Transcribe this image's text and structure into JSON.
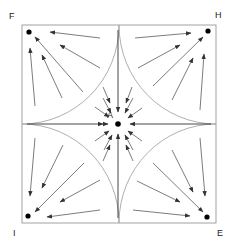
{
  "diagram": {
    "labels": {
      "top_left": "F",
      "top_right": "H",
      "bottom_left": "I",
      "bottom_right": "E",
      "center": "A"
    },
    "colors": {
      "stroke": "#555555",
      "arc": "#9a9a9a",
      "dot": "#000000"
    }
  }
}
